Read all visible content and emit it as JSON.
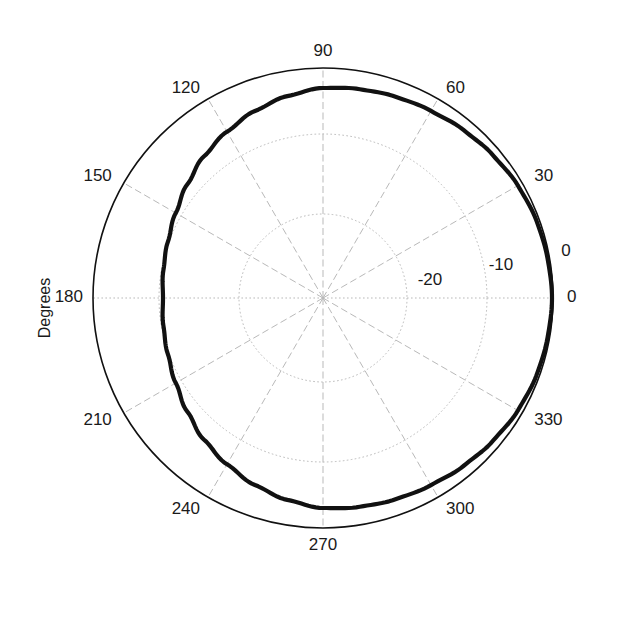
{
  "figure": {
    "background_color": "#ffffff",
    "axis_title": "Degrees",
    "center": {
      "x": 323,
      "y": 298
    },
    "outer_radius": 230,
    "grid_color": "#b9b9b9",
    "outer_ring_color": "#111111",
    "curve_color": "#111111",
    "curve_width": 4.2
  },
  "chart_data": {
    "type": "line",
    "projection": "polar",
    "title": "",
    "xlabel": "Degrees",
    "ylabel": "",
    "grid": true,
    "legend": null,
    "angular_axis": {
      "label": "Degrees",
      "unit": "degrees",
      "direction": "counterclockwise",
      "zero_location": "E",
      "range": [
        0,
        360
      ],
      "tick_step": 30,
      "tick_labels": [
        "0",
        "30",
        "60",
        "90",
        "120",
        "150",
        "180",
        "210",
        "240",
        "270",
        "300",
        "330"
      ],
      "tick_values": [
        0,
        30,
        60,
        90,
        120,
        150,
        180,
        210,
        240,
        270,
        300,
        330
      ]
    },
    "radial_axis": {
      "unit": "dB",
      "range": [
        -30,
        0
      ],
      "tick_labels": [
        "-20",
        "-10",
        "0"
      ],
      "tick_values": [
        -20,
        -10,
        0
      ],
      "tick_radii_px": [
        84,
        164,
        230
      ],
      "outer_value": 0
    },
    "series": [
      {
        "name": "pattern",
        "color": "#111111",
        "line_width": 4.2,
        "theta": [
          0,
          10,
          20,
          30,
          40,
          50,
          60,
          70,
          80,
          90,
          100,
          110,
          120,
          130,
          140,
          150,
          160,
          170,
          180,
          190,
          200,
          210,
          220,
          230,
          240,
          250,
          260,
          270,
          280,
          290,
          300,
          310,
          320,
          330,
          340,
          350,
          360
        ],
        "r_db": [
          -0.1,
          -0.2,
          -0.4,
          -0.7,
          -1.0,
          -1.4,
          -1.8,
          -2.1,
          -2.4,
          -2.6,
          -3.2,
          -4.0,
          -4.9,
          -5.9,
          -6.9,
          -7.8,
          -8.5,
          -8.9,
          -9.1,
          -8.9,
          -8.5,
          -7.8,
          -6.9,
          -5.9,
          -4.9,
          -4.0,
          -3.2,
          -2.6,
          -2.4,
          -2.1,
          -1.8,
          -1.4,
          -1.0,
          -0.7,
          -0.4,
          -0.2,
          -0.1
        ],
        "r_px": [
          229,
          228,
          227,
          225,
          222,
          219,
          216,
          214,
          212,
          210,
          205,
          199,
          192,
          185,
          177,
          170,
          165,
          162,
          160,
          162,
          165,
          170,
          177,
          185,
          192,
          199,
          205,
          210,
          212,
          214,
          216,
          219,
          222,
          225,
          227,
          228,
          229
        ]
      }
    ]
  },
  "angular_ticks": [
    {
      "value": 0,
      "label": "0",
      "anchor": "start",
      "dx": 14,
      "dy": 0
    },
    {
      "value": 30,
      "label": "30",
      "anchor": "start",
      "dx": 12,
      "dy": -6
    },
    {
      "value": 60,
      "label": "60",
      "anchor": "start",
      "dx": 8,
      "dy": -10
    },
    {
      "value": 90,
      "label": "90",
      "anchor": "middle",
      "dx": 0,
      "dy": -16
    },
    {
      "value": 120,
      "label": "120",
      "anchor": "end",
      "dx": -8,
      "dy": -10
    },
    {
      "value": 150,
      "label": "150",
      "anchor": "end",
      "dx": -12,
      "dy": -6
    },
    {
      "value": 180,
      "label": "180",
      "anchor": "end",
      "dx": -10,
      "dy": 0
    },
    {
      "value": 210,
      "label": "210",
      "anchor": "end",
      "dx": -12,
      "dy": 8
    },
    {
      "value": 240,
      "label": "240",
      "anchor": "end",
      "dx": -8,
      "dy": 12
    },
    {
      "value": 270,
      "label": "270",
      "anchor": "middle",
      "dx": 0,
      "dy": 18
    },
    {
      "value": 300,
      "label": "300",
      "anchor": "start",
      "dx": 8,
      "dy": 12
    },
    {
      "value": 330,
      "label": "330",
      "anchor": "start",
      "dx": 12,
      "dy": 8
    }
  ],
  "radial_ticks": [
    {
      "value": -20,
      "label": "-20",
      "radius_px": 84,
      "label_x": 430,
      "label_y": 281
    },
    {
      "value": -10,
      "label": "-10",
      "radius_px": 164,
      "label_x": 501,
      "label_y": 266
    },
    {
      "value": 0,
      "label": "0",
      "radius_px": 230,
      "label_x": 566,
      "label_y": 252
    }
  ]
}
